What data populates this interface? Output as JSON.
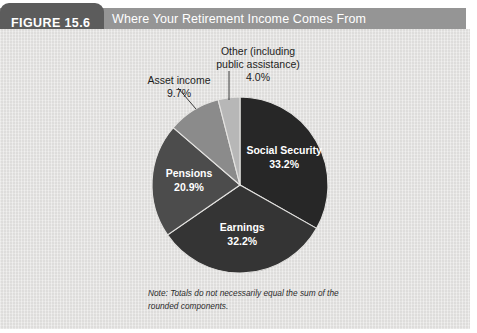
{
  "header": {
    "figure_label": "FIGURE 15.6",
    "title": "Where Your Retirement Income Comes From"
  },
  "note": {
    "line1": "Note: Totals do not necessarily equal the sum of the",
    "line2": "rounded components."
  },
  "callouts": {
    "other": {
      "line1": "Other (including",
      "line2": "public assistance)",
      "value": "4.0%"
    },
    "asset": {
      "line1": "Asset income",
      "value": "9.7%"
    }
  },
  "inner_labels": {
    "social_security": {
      "name": "Social Security",
      "value": "33.2%"
    },
    "earnings": {
      "name": "Earnings",
      "value": "32.2%"
    },
    "pensions": {
      "name": "Pensions",
      "value": "20.9%"
    }
  },
  "chart_data": {
    "type": "pie",
    "title": "Where Your Retirement Income Comes From",
    "subtitle": "",
    "xlabel": "",
    "ylabel": "",
    "legend_position": "none",
    "grid": false,
    "start_angle_deg": 0,
    "direction": "clockwise",
    "unit": "percent",
    "total": 100.0,
    "categories": [
      "Social Security",
      "Earnings",
      "Pensions",
      "Asset income",
      "Other (including public assistance)"
    ],
    "values": [
      33.2,
      32.2,
      20.9,
      9.7,
      4.0
    ],
    "labels": [
      "33.2%",
      "32.2%",
      "20.9%",
      "9.7%",
      "4.0%"
    ],
    "colors": [
      "#272727",
      "#343434",
      "#4c4c4c",
      "#8b8b8b",
      "#b7b7b7"
    ],
    "label_placement": [
      "inside",
      "inside",
      "inside",
      "outside",
      "outside"
    ],
    "annotations": [
      "Note: Totals do not necessarily equal the sum of the rounded components."
    ]
  },
  "colors": {
    "figure_tab_bg": "#5c5c5c",
    "title_bar_bg": "#959595",
    "panel_bg": "#e4e3e1",
    "slice_social_security": "#272727",
    "slice_earnings": "#343434",
    "slice_pensions": "#4c4c4c",
    "slice_asset_income": "#8b8b8b",
    "slice_other": "#b7b7b7",
    "inner_label_text": "#ffffff",
    "outer_label_text": "#1d1d1d"
  }
}
